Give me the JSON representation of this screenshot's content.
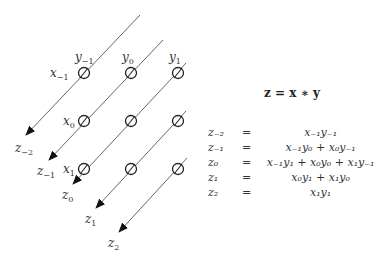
{
  "diagram": {
    "inputs_x": [
      {
        "id": "x_-1",
        "label": "x",
        "sub": "−1"
      },
      {
        "id": "x_0",
        "label": "x",
        "sub": "0"
      },
      {
        "id": "x_1",
        "label": "x",
        "sub": "1"
      }
    ],
    "inputs_y": [
      {
        "id": "y_-1",
        "label": "y",
        "sub": "−1"
      },
      {
        "id": "y_0",
        "label": "y",
        "sub": "0"
      },
      {
        "id": "y_1",
        "label": "y",
        "sub": "1"
      }
    ],
    "outputs_z": [
      {
        "id": "z_-2",
        "label": "z",
        "sub": "−2"
      },
      {
        "id": "z_-1",
        "label": "z",
        "sub": "−1"
      },
      {
        "id": "z_0",
        "label": "z",
        "sub": "0"
      },
      {
        "id": "z_1",
        "label": "z",
        "sub": "1"
      },
      {
        "id": "z_2",
        "label": "z",
        "sub": "2"
      }
    ],
    "grid": {
      "rows": 3,
      "cols": 3,
      "node_symbol": "∅"
    },
    "colors": {
      "line": "#555555",
      "text": "#333333",
      "background": "#ffffff"
    }
  },
  "equations": {
    "title": "z = x ∗ y",
    "rows": [
      {
        "lhs": "z₋₂",
        "op": "=",
        "rhs": "x₋₁y₋₁"
      },
      {
        "lhs": "z₋₁",
        "op": "=",
        "rhs": "x₋₁y₀ + x₀y₋₁"
      },
      {
        "lhs": "z₀",
        "op": "=",
        "rhs": "x₋₁y₁ + x₀y₀ + x₁y₋₁"
      },
      {
        "lhs": "z₁",
        "op": "=",
        "rhs": "x₀y₁ + x₁y₀"
      },
      {
        "lhs": "z₂",
        "op": "=",
        "rhs": "x₁y₁"
      }
    ]
  }
}
